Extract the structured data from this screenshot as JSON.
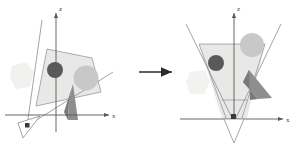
{
  "figure": {
    "type": "diagram",
    "background": "#ffffff"
  },
  "colors": {
    "axis": "#58585a",
    "outline": "#8d8d8f",
    "frustum_fill": "#e8e8e6",
    "frustum_stroke": "#8d8d8f",
    "dark_circle": "#595959",
    "light_circle": "#c3c3c3",
    "wedge": "#9a9a9a",
    "wedge_dark": "#7c7c7c",
    "faint_blob": "#f1f1ef",
    "arrow": "#2b2b2b"
  },
  "left_panel": {
    "name": "skewed-view-frustum",
    "axes": {
      "z_label": "z",
      "x_label": "x"
    },
    "objects": [
      {
        "name": "dark-sphere",
        "fill": "#595959"
      },
      {
        "name": "light-sphere",
        "fill": "#c3c3c3"
      },
      {
        "name": "dark-wedge",
        "fill": "#8b8b8b"
      },
      {
        "name": "faint-blob",
        "fill": "#f1f1ef"
      }
    ],
    "camera_marker": {
      "name": "camera-triangle",
      "orientation": "tilted"
    }
  },
  "right_panel": {
    "name": "rectified-view-frustum",
    "axes": {
      "z_label": "z",
      "x_label": "x"
    },
    "objects": [
      {
        "name": "dark-sphere",
        "fill": "#595959"
      },
      {
        "name": "light-sphere",
        "fill": "#c3c3c3"
      },
      {
        "name": "dark-wedge",
        "fill": "#8b8b8b"
      },
      {
        "name": "faint-blob",
        "fill": "#f1f1ef"
      }
    ],
    "camera_marker": {
      "name": "camera-triangle",
      "orientation": "vertical"
    }
  },
  "transition": {
    "name": "transformation-arrow",
    "direction": "right"
  }
}
